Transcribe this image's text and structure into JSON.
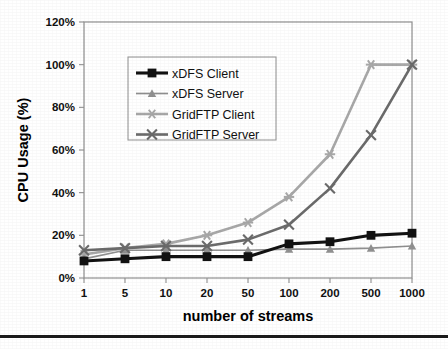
{
  "figure": {
    "name": "cpu-usage-vs-streams-chart",
    "background": "#ffffff",
    "bottom_rule_color": "#1a1a1a"
  },
  "chart_data": {
    "type": "line",
    "title": "",
    "subtitle": "",
    "xlabel": "number of streams",
    "ylabel": "CPU Usage (%)",
    "categories": [
      "1",
      "5",
      "10",
      "20",
      "50",
      "100",
      "200",
      "500",
      "1000"
    ],
    "ylim": [
      0,
      120
    ],
    "yticks": [
      0,
      20,
      40,
      60,
      80,
      100,
      120
    ],
    "ytick_labels": [
      "0%",
      "20%",
      "40%",
      "60%",
      "80%",
      "100%",
      "120%"
    ],
    "xtick_labels": [
      "1",
      "5",
      "10",
      "20",
      "50",
      "100",
      "200",
      "500",
      "1000"
    ],
    "grid": false,
    "legend_position": "upper-left-inside",
    "axis_color": "#8a8a8a",
    "series": [
      {
        "name": "xDFS Client",
        "color": "#121212",
        "marker": "square",
        "line_width": 3.1,
        "values": [
          8,
          9,
          10,
          10,
          10,
          16,
          17,
          20,
          21
        ]
      },
      {
        "name": "xDFS Server",
        "color": "#909090",
        "marker": "triangle",
        "line_width": 1.7,
        "values": [
          9,
          13,
          13,
          13,
          13,
          13.5,
          13.5,
          14,
          15
        ]
      },
      {
        "name": "GridFTP Client",
        "color": "#a8a8a8",
        "marker": "star",
        "line_width": 2.6,
        "values": [
          11,
          14,
          16,
          20,
          26,
          38,
          58,
          100,
          100
        ]
      },
      {
        "name": "GridFTP Server",
        "color": "#6b6b6b",
        "marker": "cross",
        "line_width": 2.6,
        "values": [
          13,
          14,
          15,
          15,
          18,
          25,
          42,
          67,
          100
        ]
      }
    ]
  },
  "legend": {
    "border_color": "#9a9a9a",
    "entries": [
      {
        "label": "xDFS Client"
      },
      {
        "label": "xDFS Server"
      },
      {
        "label": "GridFTP Client"
      },
      {
        "label": "GridFTP Server"
      }
    ]
  }
}
